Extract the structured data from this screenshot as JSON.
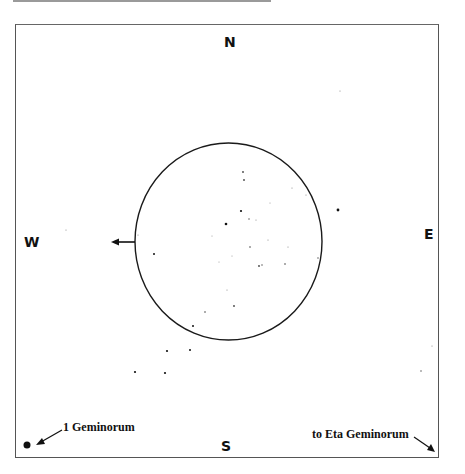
{
  "chart_data": {
    "type": "scatter",
    "title": "",
    "directions": {
      "north": "N",
      "south": "S",
      "east": "E",
      "west": "W"
    },
    "annotations": [
      {
        "text": "1 Geminorum",
        "arrow": "points to bright star at lower-left"
      },
      {
        "text": "to Eta Geminorum",
        "arrow": "points off chart to lower-right"
      }
    ],
    "field_circle": {
      "cx": 228.5,
      "cy": 241.5,
      "rx": 93.5,
      "ry": 98.5
    },
    "west_arrow": {
      "from": [
        135,
        242
      ],
      "to": [
        112,
        242
      ]
    },
    "stars": [
      {
        "x": 27,
        "y": 445,
        "r": 3.5,
        "name": "1 Geminorum"
      },
      {
        "x": 338,
        "y": 210,
        "r": 1.4
      },
      {
        "x": 340,
        "y": 91,
        "r": 0.6
      },
      {
        "x": 167,
        "y": 351,
        "r": 1.1
      },
      {
        "x": 190,
        "y": 350,
        "r": 1.0
      },
      {
        "x": 135,
        "y": 372,
        "r": 1.1
      },
      {
        "x": 165,
        "y": 373,
        "r": 1.1
      },
      {
        "x": 432,
        "y": 346,
        "r": 0.6
      },
      {
        "x": 421,
        "y": 371,
        "r": 0.7
      },
      {
        "x": 66,
        "y": 230,
        "r": 0.6
      },
      {
        "x": 243,
        "y": 172,
        "r": 0.9
      },
      {
        "x": 244,
        "y": 180,
        "r": 0.9
      },
      {
        "x": 241,
        "y": 211,
        "r": 1.1
      },
      {
        "x": 226,
        "y": 224,
        "r": 1.3
      },
      {
        "x": 249,
        "y": 219,
        "r": 0.7
      },
      {
        "x": 256,
        "y": 220,
        "r": 0.6
      },
      {
        "x": 250,
        "y": 247,
        "r": 0.8
      },
      {
        "x": 259,
        "y": 266,
        "r": 0.9
      },
      {
        "x": 262,
        "y": 265,
        "r": 0.7
      },
      {
        "x": 268,
        "y": 240,
        "r": 0.6
      },
      {
        "x": 285,
        "y": 264,
        "r": 0.8
      },
      {
        "x": 288,
        "y": 247,
        "r": 0.6
      },
      {
        "x": 292,
        "y": 188,
        "r": 0.6
      },
      {
        "x": 306,
        "y": 195,
        "r": 0.6
      },
      {
        "x": 318,
        "y": 258,
        "r": 0.7
      },
      {
        "x": 154,
        "y": 254,
        "r": 1.0
      },
      {
        "x": 138,
        "y": 235,
        "r": 0.6
      },
      {
        "x": 234,
        "y": 306,
        "r": 0.9
      },
      {
        "x": 205,
        "y": 312,
        "r": 0.8
      },
      {
        "x": 193,
        "y": 326,
        "r": 1.0
      },
      {
        "x": 227,
        "y": 290,
        "r": 0.6
      },
      {
        "x": 232,
        "y": 256,
        "r": 0.5
      },
      {
        "x": 219,
        "y": 262,
        "r": 0.5
      },
      {
        "x": 270,
        "y": 203,
        "r": 0.5
      },
      {
        "x": 212,
        "y": 236,
        "r": 0.5
      }
    ]
  },
  "labels": {
    "north": "N",
    "south": "S",
    "east": "E",
    "west": "W",
    "star_1_gem": "1 Geminorum",
    "eta_gem": "to Eta Geminorum"
  }
}
